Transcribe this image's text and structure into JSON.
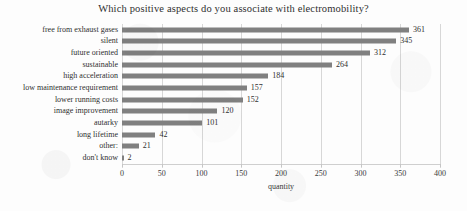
{
  "chart_data": {
    "type": "bar",
    "orientation": "horizontal",
    "title": "Which positive aspects do you associate with electromobility?",
    "xlabel": "quantity",
    "ylabel": "",
    "xlim": [
      0,
      400
    ],
    "xticks": [
      0,
      50,
      100,
      150,
      200,
      250,
      300,
      350,
      400
    ],
    "grid": true,
    "legend": "none",
    "bar_color": "#808080",
    "categories": [
      "free from exhaust gases",
      "silent",
      "future oriented",
      "sustainable",
      "high acceleration",
      "low maintenance requirement",
      "lower running costs",
      "image improvement",
      "autarky",
      "long lifetime",
      "other:",
      "don't know"
    ],
    "values": [
      361,
      345,
      312,
      264,
      184,
      157,
      152,
      120,
      101,
      42,
      21,
      2
    ]
  }
}
